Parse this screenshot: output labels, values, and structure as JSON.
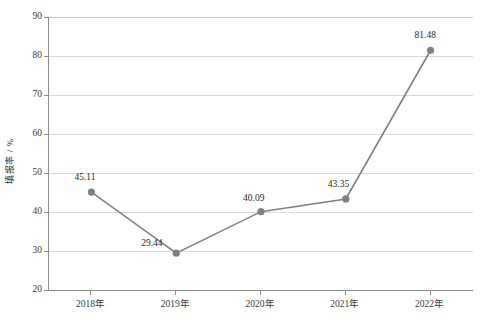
{
  "chart_data": {
    "type": "line",
    "title": "",
    "xlabel": "",
    "ylabel": "填报率 / %",
    "categories": [
      "2018年",
      "2019年",
      "2020年",
      "2021年",
      "2022年"
    ],
    "values": [
      45.11,
      29.44,
      40.09,
      43.35,
      81.48
    ],
    "point_labels": [
      "45.11",
      "29.44",
      "40.09",
      "43.35",
      "81.48"
    ],
    "ylim": [
      20,
      90
    ],
    "yticks": [
      20,
      30,
      40,
      50,
      60,
      70,
      80,
      90
    ],
    "ytick_labels": [
      "20",
      "30",
      "40",
      "50",
      "60",
      "70",
      "80",
      "90"
    ],
    "grid": true,
    "legend": false,
    "series": [
      {
        "name": "填报率",
        "values": [
          45.11,
          29.44,
          40.09,
          43.35,
          81.48
        ],
        "color": "#808080",
        "marker": "circle"
      }
    ],
    "colors": {
      "line": "#808080",
      "marker": "#808080",
      "grid": "#d9d9d9",
      "axis": "#8c8c8c",
      "text": "#2b2b2b",
      "background": "#ffffff"
    }
  }
}
